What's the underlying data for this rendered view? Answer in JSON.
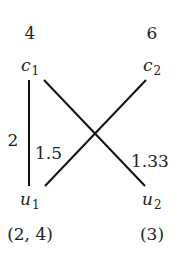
{
  "top_nodes": [
    {
      "name": "c",
      "sub": "1",
      "value": "4"
    },
    {
      "name": "c",
      "sub": "2",
      "value": "6"
    }
  ],
  "bottom_nodes": [
    {
      "name": "u",
      "sub": "1",
      "value": "(2, 4)"
    },
    {
      "name": "u",
      "sub": "2",
      "value": "(3)"
    }
  ],
  "edges": [
    {
      "from": "c1",
      "to": "u1",
      "weight": "2"
    },
    {
      "from": "c2",
      "to": "u1",
      "weight": "1.5"
    },
    {
      "from": "c1",
      "to": "u2",
      "weight": "1.33"
    }
  ]
}
